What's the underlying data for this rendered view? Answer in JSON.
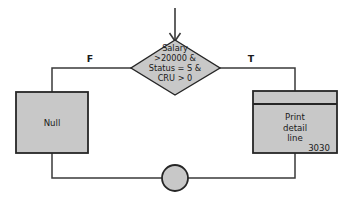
{
  "diagram": {
    "type": "flowchart",
    "background_color": "#ffffff",
    "shape_fill_color": "#c8c8c8",
    "shape_stroke_color": "#262626",
    "connector_color": "#3a3a3a",
    "text_color": "#1a1a1a"
  },
  "entry": {
    "arrow_name": "entry-arrow",
    "direction": "down"
  },
  "decision": {
    "shape": "diamond",
    "lines": [
      "Salary",
      ">20000 &",
      "Status = S &",
      "CRU > 0"
    ]
  },
  "branches": {
    "false_label": "F",
    "true_label": "T"
  },
  "false_node": {
    "shape": "rectangle",
    "label": "Null"
  },
  "true_node": {
    "shape": "document-process",
    "lines": [
      "Print",
      "detail",
      "line"
    ],
    "code": "3030"
  },
  "merge": {
    "shape": "circle",
    "label": ""
  }
}
